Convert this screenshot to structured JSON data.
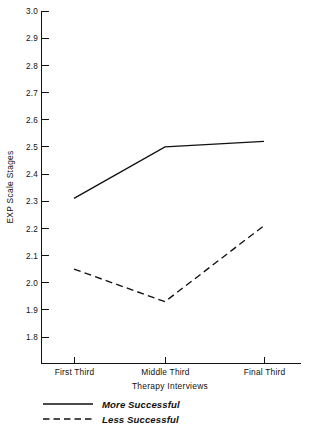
{
  "chart_data": {
    "type": "line",
    "title": "",
    "xlabel": "Therapy Interviews",
    "ylabel": "EXP Scale Stages",
    "categories": [
      "First Third",
      "Middle Third",
      "Final Third"
    ],
    "ylim": [
      1.75,
      3.0
    ],
    "yticks": [
      "1.8",
      "1.9",
      "2.0",
      "2.1",
      "2.2",
      "2.3",
      "2.4",
      "2.5",
      "2.6",
      "2.7",
      "2.8",
      "2.9",
      "3.0"
    ],
    "ytick_values": [
      1.8,
      1.9,
      2.0,
      2.1,
      2.2,
      2.3,
      2.4,
      2.5,
      2.6,
      2.7,
      2.8,
      2.9,
      3.0
    ],
    "grid": false,
    "legend_position": "below-axis-left",
    "series": [
      {
        "name": "More Successful",
        "style": "solid",
        "values": [
          2.31,
          2.5,
          2.52
        ]
      },
      {
        "name": "Less Successful",
        "style": "dashed",
        "values": [
          2.05,
          1.93,
          2.21
        ]
      }
    ]
  },
  "axes": {
    "y_title": "EXP Scale Stages",
    "x_title": "Therapy Interviews"
  },
  "legend": {
    "entries": [
      {
        "label": "More Successful",
        "style": "solid"
      },
      {
        "label": "Less Successful",
        "style": "dashed"
      }
    ]
  },
  "yticks": {
    "t0": "1.8",
    "t1": "1.9",
    "t2": "2.0",
    "t3": "2.1",
    "t4": "2.2",
    "t5": "2.3",
    "t6": "2.4",
    "t7": "2.5",
    "t8": "2.6",
    "t9": "2.7",
    "t10": "2.8",
    "t11": "2.9",
    "t12": "3.0"
  },
  "xticks": {
    "t0": "First Third",
    "t1": "Middle Third",
    "t2": "Final Third"
  },
  "colors": {
    "ink": "#111111",
    "background": "#ffffff"
  }
}
